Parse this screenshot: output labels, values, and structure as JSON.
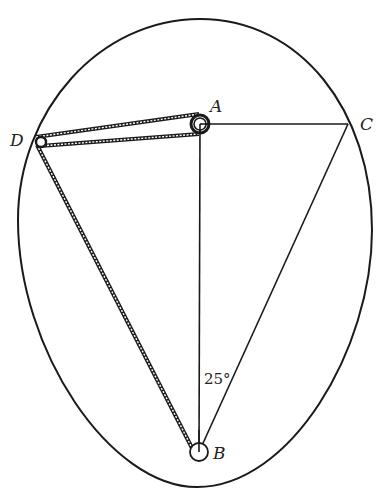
{
  "diagram": {
    "type": "pulley-belt geometry inside egg-shaped boundary",
    "points": {
      "A": {
        "label": "A",
        "x": 200,
        "y": 124
      },
      "B": {
        "label": "B",
        "x": 199,
        "y": 452
      },
      "C": {
        "label": "C",
        "x": 348,
        "y": 124
      },
      "D": {
        "label": "D",
        "x": 40,
        "y": 142
      }
    },
    "angle_label": "25°",
    "colors": {
      "stroke": "#1a1a1a",
      "background": "#ffffff"
    }
  }
}
